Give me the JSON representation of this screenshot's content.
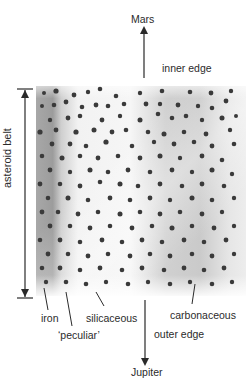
{
  "diagram": {
    "title": "",
    "top_target": {
      "label": "Mars"
    },
    "bottom_target": {
      "label": "Jupiter"
    },
    "inner_edge_label": "inner edge",
    "outer_edge_label": "outer edge",
    "belt_axis_label": "asteroid belt",
    "composition_zones": [
      {
        "label": "iron",
        "order": 1
      },
      {
        "label": "‘peculiar’",
        "order": 2
      },
      {
        "label": "silicaceous",
        "order": 3
      },
      {
        "label": "carbonaceous",
        "order": 4
      }
    ],
    "colors": {
      "ink": "#2b2b2b",
      "asteroid": "#3a3a3a",
      "dark_band": "#9a9a9a",
      "light_band": "#f2f2f2",
      "background": "#ffffff"
    }
  }
}
